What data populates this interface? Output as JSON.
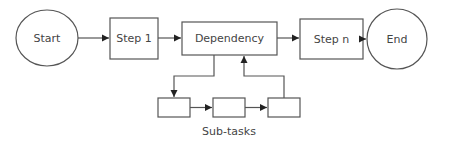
{
  "diagram": {
    "type": "flowchart",
    "nodes": {
      "start": {
        "label": "Start",
        "shape": "ellipse"
      },
      "step1": {
        "label": "Step 1",
        "shape": "rectangle"
      },
      "dependency": {
        "label": "Dependency",
        "shape": "rectangle"
      },
      "stepn": {
        "label": "Step n",
        "shape": "rectangle"
      },
      "end": {
        "label": "End",
        "shape": "circle"
      },
      "subtask1": {
        "label": "",
        "shape": "rectangle"
      },
      "subtask2": {
        "label": "",
        "shape": "rectangle"
      },
      "subtask3": {
        "label": "",
        "shape": "rectangle"
      }
    },
    "group_label": "Sub-tasks",
    "edges": [
      {
        "from": "Start",
        "to": "Step 1"
      },
      {
        "from": "Step 1",
        "to": "Dependency"
      },
      {
        "from": "Dependency",
        "to": "Step n"
      },
      {
        "from": "Step n",
        "to": "End"
      },
      {
        "from": "Dependency",
        "to": "Sub-task 1"
      },
      {
        "from": "Sub-task 1",
        "to": "Sub-task 2"
      },
      {
        "from": "Sub-task 2",
        "to": "Sub-task 3"
      },
      {
        "from": "Sub-task 3",
        "to": "Dependency"
      }
    ],
    "colors": {
      "stroke": "#555555",
      "arrow": "#222222",
      "text": "#444444",
      "background": "#ffffff"
    }
  }
}
